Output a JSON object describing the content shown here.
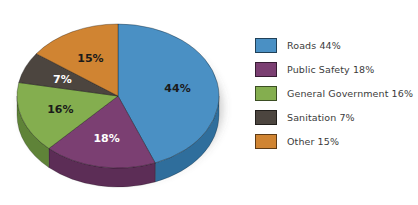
{
  "chart_data": {
    "type": "pie",
    "title": "",
    "xlabel": "",
    "ylabel": "",
    "categories": [
      "Roads",
      "Public Safety",
      "General Government",
      "Sanitation",
      "Other"
    ],
    "values": [
      44,
      18,
      16,
      7,
      15
    ],
    "value_suffix": "%",
    "legend_position": "right",
    "grid": false,
    "three_d": true,
    "slice_labels": [
      "44%",
      "18%",
      "16%",
      "7%",
      "15%"
    ],
    "colors": [
      "#4a90c4",
      "#7b3f72",
      "#84ae4f",
      "#4c453f",
      "#d08432"
    ],
    "side_colors": [
      "#2f6e9c",
      "#5c2d56",
      "#5f8338",
      "#35302b",
      "#a4641f"
    ],
    "label_colors": [
      "#1a1a1a",
      "#ffffff",
      "#1a1a1a",
      "#ffffff",
      "#1a1a1a"
    ],
    "background": "#ffffff"
  },
  "legend": {
    "items": [
      {
        "label": "Roads 44%",
        "swatch_name": "legend-swatch-roads"
      },
      {
        "label": "Public Safety 18%",
        "swatch_name": "legend-swatch-public-safety"
      },
      {
        "label": "General Government 16%",
        "swatch_name": "legend-swatch-general-government"
      },
      {
        "label": "Sanitation 7%",
        "swatch_name": "legend-swatch-sanitation"
      },
      {
        "label": "Other 15%",
        "swatch_name": "legend-swatch-other"
      }
    ]
  }
}
